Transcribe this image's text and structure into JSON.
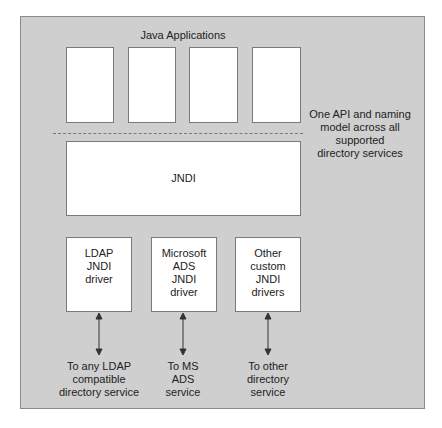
{
  "diagram": {
    "title": "Java Applications",
    "app_boxes": [
      "",
      "",
      "",
      ""
    ],
    "side_note": "One API and naming\nmodel across all\nsupported\ndirectory services",
    "core": {
      "label": "JNDI"
    },
    "drivers": [
      {
        "label": "LDAP\nJNDI\ndriver",
        "target": "To any LDAP\ncompatible\ndirectory service"
      },
      {
        "label": "Microsoft\nADS\nJNDI\ndriver",
        "target": "To MS\nADS\nservice"
      },
      {
        "label": "Other\ncustom\nJNDI\ndrivers",
        "target": "To other\ndirectory\nservice"
      }
    ],
    "colors": {
      "background": "#cfcfcf",
      "box": "#ffffff",
      "border": "#7a7a7a",
      "arrow": "#333333"
    }
  }
}
